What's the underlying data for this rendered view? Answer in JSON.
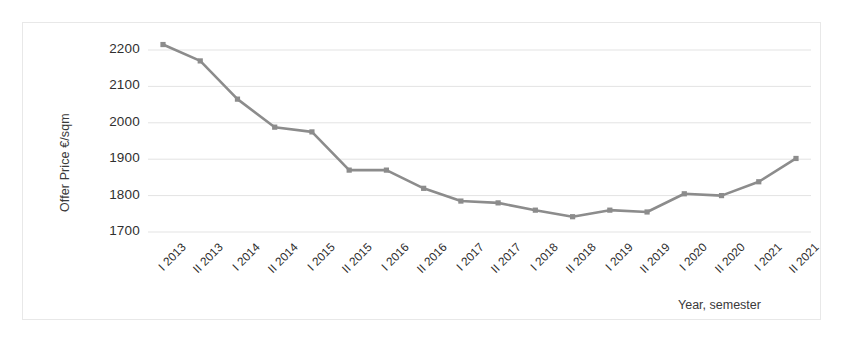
{
  "chart_data": {
    "type": "line",
    "title": "",
    "subtitle": "",
    "xlabel": "Year, semester",
    "ylabel": "Offer Price €/sqm",
    "categories": [
      "I 2013",
      "II 2013",
      "I 2014",
      "II 2014",
      "I 2015",
      "II 2015",
      "I 2016",
      "II 2016",
      "I 2017",
      "II 2017",
      "I 2018",
      "II 2018",
      "I 2019",
      "II 2019",
      "I 2020",
      "II 2020",
      "I 2021",
      "II 2021"
    ],
    "values": [
      2215,
      2170,
      2065,
      1988,
      1975,
      1870,
      1870,
      1820,
      1785,
      1780,
      1760,
      1742,
      1760,
      1755,
      1805,
      1800,
      1838,
      1902
    ],
    "series": [
      {
        "name": "Offer Price",
        "values": [
          2215,
          2170,
          2065,
          1988,
          1975,
          1870,
          1870,
          1820,
          1785,
          1780,
          1760,
          1742,
          1760,
          1755,
          1805,
          1800,
          1838,
          1902
        ]
      }
    ],
    "ylim": [
      1700,
      2250
    ],
    "yticks": [
      1700,
      1800,
      1900,
      2000,
      2100,
      2200
    ],
    "ytick_labels": [
      "1700",
      "1800",
      "1900",
      "2000",
      "2100",
      "2200"
    ],
    "grid": true,
    "grid_axis": "y",
    "legend": false,
    "legend_position": "none",
    "line_color": "#8c8c8c",
    "marker": "square",
    "marker_color": "#8c8c8c",
    "grid_color": "#e3e3e3",
    "border_color": "#e8e8e8",
    "background": "#ffffff",
    "text_color": "#2f2f2f"
  }
}
